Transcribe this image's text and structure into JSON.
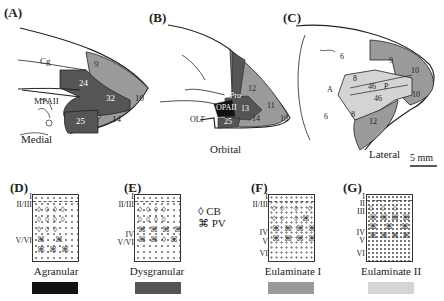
{
  "colors": {
    "agranular": "#111111",
    "dysgranular": "#555555",
    "eulaminate1": "#9a9a9a",
    "eulaminate2": "#d4d4d4",
    "line": "#222222"
  },
  "panels": {
    "A": {
      "label": "(A)",
      "view": "Medial",
      "areas": [
        "9",
        "24",
        "32",
        "10",
        "25",
        "14"
      ],
      "landmarks": [
        "Cg",
        "MPAII"
      ]
    },
    "B": {
      "label": "(B)",
      "view": "Orbital",
      "areas": [
        "12",
        "OPro",
        "OPAII",
        "13",
        "11",
        "14",
        "25",
        "10"
      ],
      "landmarks": [
        "OLF"
      ]
    },
    "C": {
      "label": "(C)",
      "view": "Lateral",
      "areas": [
        "6",
        "9",
        "10",
        "8",
        "46",
        "P",
        "46",
        "10",
        "8",
        "6",
        "12"
      ],
      "landmarks": [
        "A"
      ]
    },
    "D": {
      "label": "(D)",
      "type": "Agranular",
      "layers": [
        "I",
        "II/III",
        "V/VI"
      ]
    },
    "E": {
      "label": "(E)",
      "type": "Dysgranular",
      "layers": [
        "I",
        "II/III",
        "IV",
        "V/VI"
      ]
    },
    "F": {
      "label": "(F)",
      "type": "Eulaminate I",
      "layers": [
        "I",
        "II/III",
        "IV",
        "V",
        "VI"
      ]
    },
    "G": {
      "label": "(G)",
      "type": "Eulaminate II",
      "layers": [
        "I",
        "II",
        "III",
        "IV",
        "V",
        "VI"
      ]
    }
  },
  "legend": {
    "cb_symbol": "◊",
    "cb_label": "CB",
    "pv_symbol": "⌘",
    "pv_label": "PV"
  },
  "scale": {
    "label": "5 mm"
  }
}
